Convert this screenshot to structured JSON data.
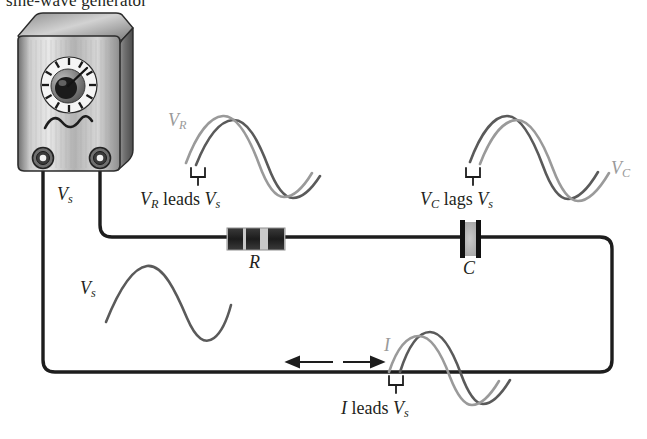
{
  "figure": {
    "type": "series-rc-circuit-phase-diagram",
    "caption_partial": "sine-wave generator",
    "components": {
      "generator": {
        "name": "signal generator",
        "symbol": "sine-wave",
        "dial": "rotary knob with tick marks",
        "terminals": 2
      },
      "resistor": {
        "label": "R",
        "bands": 3
      },
      "capacitor": {
        "label": "C",
        "plates": 2
      }
    },
    "labels": {
      "source_wave_left": "V",
      "source_wave_left_sub": "s",
      "source_terminal": "V",
      "source_terminal_sub": "s",
      "vr": "V",
      "vr_sub": "R",
      "vr_caption_1": "V",
      "vr_caption_1_sub": "R",
      "vr_caption_mid": " leads ",
      "vr_caption_2": "V",
      "vr_caption_2_sub": "s",
      "vc": "V",
      "vc_sub": "C",
      "vc_caption_1": "V",
      "vc_caption_1_sub": "C",
      "vc_caption_mid": " lags ",
      "vc_caption_2": "V",
      "vc_caption_2_sub": "s",
      "current": "I",
      "i_caption_1": "I",
      "i_caption_mid": " leads ",
      "i_caption_2": "V",
      "i_caption_2_sub": "s"
    },
    "arrows": {
      "left_arrow": "current-direction-left",
      "right_arrow": "current-direction-right"
    },
    "colors": {
      "wire": "#1d1d1d",
      "source_wave": "#5a5a5a",
      "phase_wave": "#9a9a9a",
      "text": "#231f20",
      "gray_text": "#9a9a9a",
      "resistor_body": "#2e2e2e",
      "capacitor_plate": "#111111",
      "capacitor_fill": "#b5b5b5",
      "generator_body": "#b9b9b9"
    }
  }
}
